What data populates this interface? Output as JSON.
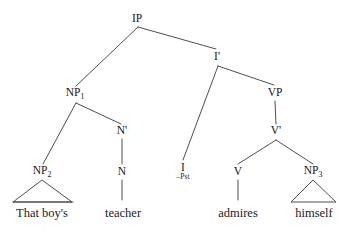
{
  "diagram": {
    "type": "syntax-tree",
    "sentence": "That boy's teacher admires himself",
    "background_color": "#ffffff",
    "line_color": "#3a3a3a",
    "text_color": "#141414"
  },
  "nodes": [
    {
      "id": "IP",
      "label": "IP",
      "sub": "",
      "x": 137,
      "y": 19,
      "kind": "category"
    },
    {
      "id": "NP1",
      "label": "NP",
      "sub": "1",
      "x": 75,
      "y": 94,
      "kind": "category"
    },
    {
      "id": "Ibar",
      "label": "I'",
      "sub": "",
      "x": 217,
      "y": 57,
      "kind": "category"
    },
    {
      "id": "VP",
      "label": "VP",
      "sub": "",
      "x": 275,
      "y": 93,
      "kind": "category"
    },
    {
      "id": "Nbar",
      "label": "N'",
      "sub": "",
      "x": 122,
      "y": 131,
      "kind": "category"
    },
    {
      "id": "Vbar",
      "label": "V'",
      "sub": "",
      "x": 276,
      "y": 131,
      "kind": "category"
    },
    {
      "id": "NP2",
      "label": "NP",
      "sub": "2",
      "x": 42,
      "y": 172,
      "kind": "category"
    },
    {
      "id": "N",
      "label": "N",
      "sub": "",
      "x": 122,
      "y": 172,
      "kind": "category"
    },
    {
      "id": "V",
      "label": "V",
      "sub": "",
      "x": 238,
      "y": 172,
      "kind": "category"
    },
    {
      "id": "NP3",
      "label": "NP",
      "sub": "3",
      "x": 313,
      "y": 172,
      "kind": "category"
    }
  ],
  "feature_nodes": [
    {
      "id": "I",
      "label": "I",
      "feature": "–Pst",
      "x": 183,
      "y": 167
    }
  ],
  "terminals": [
    {
      "id": "t-that-boys",
      "text": "That boy's",
      "x": 42,
      "y": 207
    },
    {
      "id": "t-teacher",
      "text": "teacher",
      "x": 123,
      "y": 207
    },
    {
      "id": "t-admires",
      "text": "admires",
      "x": 238,
      "y": 207
    },
    {
      "id": "t-himself",
      "text": "himself",
      "x": 314,
      "y": 207
    }
  ],
  "edges": [
    {
      "from": "IP",
      "to": "NP1",
      "x1": 138,
      "y1": 27,
      "x2": 76,
      "y2": 86
    },
    {
      "from": "IP",
      "to": "Ibar",
      "x1": 138,
      "y1": 27,
      "x2": 216,
      "y2": 49
    },
    {
      "from": "NP1",
      "to": "NP2",
      "x1": 76,
      "y1": 103,
      "x2": 43,
      "y2": 164
    },
    {
      "from": "NP1",
      "to": "Nbar",
      "x1": 76,
      "y1": 103,
      "x2": 121,
      "y2": 124
    },
    {
      "from": "Ibar",
      "to": "I",
      "x1": 218,
      "y1": 66,
      "x2": 183,
      "y2": 160
    },
    {
      "from": "Ibar",
      "to": "VP",
      "x1": 218,
      "y1": 66,
      "x2": 274,
      "y2": 85
    },
    {
      "from": "VP",
      "to": "Vbar",
      "x1": 275,
      "y1": 101,
      "x2": 276,
      "y2": 124
    },
    {
      "from": "Nbar",
      "to": "N",
      "x1": 122,
      "y1": 139,
      "x2": 122,
      "y2": 164
    },
    {
      "from": "Vbar",
      "to": "V",
      "x1": 276,
      "y1": 140,
      "x2": 238,
      "y2": 164
    },
    {
      "from": "Vbar",
      "to": "NP3",
      "x1": 276,
      "y1": 140,
      "x2": 313,
      "y2": 164
    },
    {
      "from": "N",
      "to": "t-teacher",
      "x1": 122,
      "y1": 180,
      "x2": 122,
      "y2": 200
    },
    {
      "from": "V",
      "to": "t-admires",
      "x1": 238,
      "y1": 180,
      "x2": 238,
      "y2": 200
    }
  ],
  "triangles": [
    {
      "id": "tri-np2",
      "apex_x": 42,
      "apex_y": 180,
      "left_x": 13,
      "right_x": 72,
      "base_y": 202
    },
    {
      "id": "tri-np3",
      "apex_x": 313,
      "apex_y": 180,
      "left_x": 291,
      "right_x": 336,
      "base_y": 202
    }
  ],
  "underlines": [
    {
      "id": "ul-that-boys",
      "x1": 13,
      "x2": 73,
      "y": 202
    }
  ]
}
